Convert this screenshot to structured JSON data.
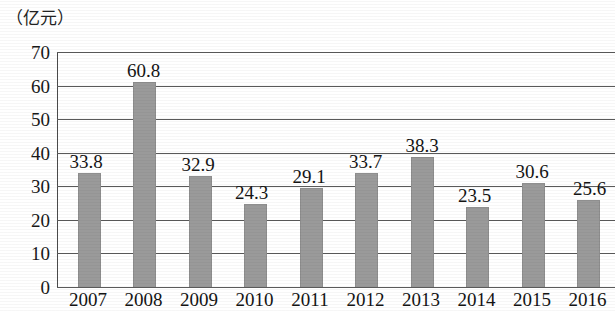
{
  "chart_data": {
    "type": "bar",
    "title": "",
    "subtitle": "",
    "unit_caption": "（亿元）",
    "xlabel": "",
    "ylabel": "",
    "categories": [
      "2007",
      "2008",
      "2009",
      "2010",
      "2011",
      "2012",
      "2013",
      "2014",
      "2015",
      "2016"
    ],
    "values": [
      33.8,
      60.8,
      32.9,
      24.3,
      29.1,
      33.7,
      38.3,
      23.5,
      30.6,
      25.6
    ],
    "value_labels": [
      "33.8",
      "60.8",
      "32.9",
      "24.3",
      "29.1",
      "33.7",
      "38.3",
      "23.5",
      "30.6",
      "25.6"
    ],
    "ylim": [
      0,
      70
    ],
    "ytick_labels": [
      "70",
      "60",
      "50",
      "40",
      "30",
      "20",
      "10",
      "0"
    ],
    "ytick_values": [
      70,
      60,
      50,
      40,
      30,
      20,
      10,
      0
    ],
    "grid": true,
    "legend": "none",
    "series": [
      {
        "name": "",
        "values": [
          33.8,
          60.8,
          32.9,
          24.3,
          29.1,
          33.7,
          38.3,
          23.5,
          30.6,
          25.6
        ]
      }
    ],
    "colors": {
      "bar_fill": "#9a9a9a",
      "gridline": "#5a5a5a",
      "axis": "#4a4a4a",
      "text": "#141414",
      "background": "#ffffff"
    }
  }
}
